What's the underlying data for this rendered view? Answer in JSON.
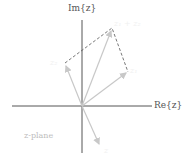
{
  "diagram": {
    "type": "complex-plane-vector-addition",
    "axes": {
      "real_label": "Re{z}",
      "imag_label": "Im{z}"
    },
    "plane_label": "z-plane",
    "vectors": [
      {
        "name": "z1",
        "label": "z₁"
      },
      {
        "name": "z2",
        "label": "z₂"
      },
      {
        "name": "sum",
        "label": "z₁ + z₂"
      },
      {
        "name": "lower",
        "label": "z"
      }
    ],
    "colors": {
      "axis": "#555555",
      "vector": "#c8c8c8",
      "dashed": "#555555"
    }
  }
}
